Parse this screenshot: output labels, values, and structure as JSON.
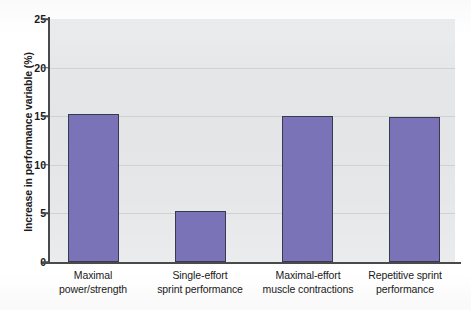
{
  "chart_data": {
    "type": "bar",
    "title": "",
    "xlabel": "",
    "ylabel": "Increase in performance variable (%)",
    "categories": [
      "Maximal power/strength",
      "Single-effort sprint performance",
      "Maximal-effort muscle contractions",
      "Repetitive sprint performance"
    ],
    "category_lines": [
      [
        "Maximal",
        "power/strength"
      ],
      [
        "Single-effort",
        "sprint performance"
      ],
      [
        "Maximal-effort",
        "muscle contractions"
      ],
      [
        "Repetitive sprint",
        "performance"
      ]
    ],
    "values": [
      15.2,
      5.2,
      15.0,
      14.9
    ],
    "ylim": [
      0,
      25
    ],
    "yticks": [
      0,
      5,
      10,
      15,
      20,
      25
    ],
    "ytick_labels": [
      "0",
      "5",
      "10",
      "15",
      "20",
      "25"
    ],
    "grid": true,
    "grid_axis": "y",
    "legend": null,
    "legend_position": "none",
    "series": [
      {
        "name": "Increase in performance variable (%)",
        "values": [
          15.2,
          5.2,
          15.0,
          14.9
        ]
      }
    ]
  },
  "style": {
    "bar_color": "#7a73b8",
    "bar_edge_color": "#3a3a4e",
    "plot_background": "#e3e5e7",
    "gridline_color": "#cfd2d5",
    "axis_color": "#4a4a4a",
    "text_color": "#1a1a1a",
    "page_background": "#ffffff"
  }
}
